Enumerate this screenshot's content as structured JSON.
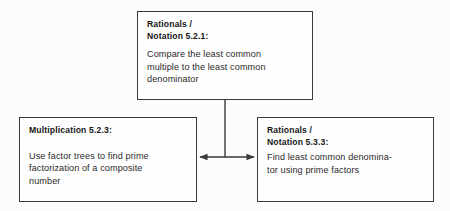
{
  "diagram": {
    "type": "flowchart",
    "background_color": "#fcfcfc",
    "line_color": "#3a3a3a",
    "nodes": [
      {
        "id": "top",
        "title": "Rationals /\nNotation 5.2.1:",
        "body": "Compare the least common\nmultiple to the least common\ndenominator"
      },
      {
        "id": "left",
        "title": "Multiplication 5.2.3:",
        "body": "Use factor trees to find prime\nfactorization of a composite\nnumber"
      },
      {
        "id": "right",
        "title": "Rationals /\nNotation 5.3.3:",
        "body": "Find least common denomina-\ntor using prime factors"
      }
    ],
    "connectors": [
      {
        "id": "stem",
        "from": "top",
        "to": "junction",
        "style": "plain-line",
        "orientation": "vertical"
      },
      {
        "id": "cross-link",
        "from": "left",
        "to": "right",
        "style": "double-arrow",
        "orientation": "horizontal"
      }
    ]
  }
}
